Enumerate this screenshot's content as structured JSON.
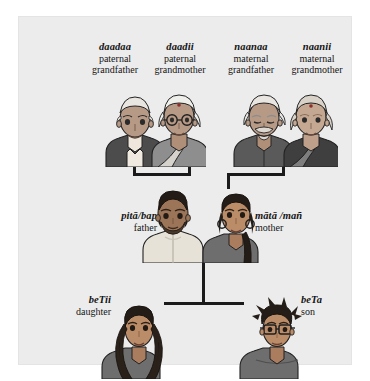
{
  "diagram": {
    "background_color": "#ececec",
    "page_color": "#ffffff",
    "line_color": "#1b1b1b",
    "generations": [
      {
        "name": "grandparents",
        "members": [
          {
            "term": "daadaa",
            "gloss_line1": "paternal",
            "gloss_line2": "grandfather"
          },
          {
            "term": "daadii",
            "gloss_line1": "paternal",
            "gloss_line2": "grandmother"
          },
          {
            "term": "naanaa",
            "gloss_line1": "maternal",
            "gloss_line2": "grandfather"
          },
          {
            "term": "naanii",
            "gloss_line1": "maternal",
            "gloss_line2": "grandmother"
          }
        ]
      },
      {
        "name": "parents",
        "members": [
          {
            "term": "pitā/bap",
            "gloss_line1": "father"
          },
          {
            "term": "mātā /mañ",
            "gloss_line1": "mother"
          }
        ]
      },
      {
        "name": "children",
        "members": [
          {
            "term": "beTii",
            "gloss_line1": "daughter"
          },
          {
            "term": "beTa",
            "gloss_line1": "son"
          }
        ]
      }
    ],
    "figures": {
      "paternal_grandparents": "portrait-paternal-grandparents",
      "maternal_grandparents": "portrait-maternal-grandparents",
      "parents": "portrait-parents",
      "daughter": "portrait-daughter",
      "son": "portrait-son"
    }
  }
}
